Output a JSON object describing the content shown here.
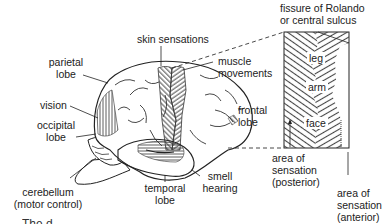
{
  "diagram": {
    "type": "brain-lateral-view-with-motor-sensory-strip",
    "labels": {
      "skin_sensations": "skin sensations",
      "parietal_lobe_1": "parietal",
      "parietal_lobe_2": "lobe",
      "vision": "vision",
      "occipital_lobe_1": "occipital",
      "occipital_lobe_2": "lobe",
      "cerebellum_1": "cerebellum",
      "cerebellum_2": "(motor control)",
      "temporal_lobe_1": "temporal",
      "temporal_lobe_2": "lobe",
      "smell": "smell",
      "hearing": "hearing",
      "muscle_movements_1": "muscle",
      "muscle_movements_2": "movements",
      "frontal_lobe_1": "frontal",
      "frontal_lobe_2": "lobe",
      "fissure_1": "fissure of Rolando",
      "fissure_2": "or central sulcus",
      "leg": "leg",
      "arm": "arm",
      "face": "face",
      "posterior_1": "area of",
      "posterior_2": "sensation",
      "posterior_3": "(posterior)",
      "anterior_1": "area of",
      "anterior_2": "sensation",
      "anterior_3": "(anterior)"
    },
    "caption": "The d..."
  }
}
